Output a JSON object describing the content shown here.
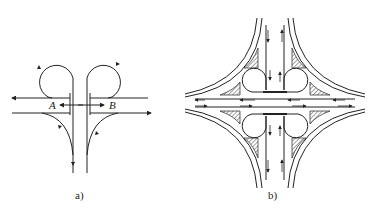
{
  "top_text_fragment": "· · · · · · · · · · · · · · · · · · · · · · ·",
  "figure_a": {
    "caption": "a)",
    "point_labels": [
      "A",
      "B"
    ],
    "description": "Partial cloverleaf / half-cloverleaf interchange with two loop ramps and two directional ramps"
  },
  "figure_b": {
    "caption": "b)",
    "description": "Full interchange with four loop ramps, four outer connector ramps and hatched islands"
  },
  "colors": {
    "line": "#222222",
    "hatch": "#444444",
    "background": "#ffffff"
  }
}
